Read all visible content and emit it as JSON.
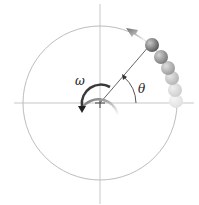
{
  "diagram": {
    "labels": {
      "omega": "ω",
      "theta": "θ"
    },
    "colors": {
      "axis": "#c8c8c8",
      "circle": "#bdbdbd",
      "radius": "#555555",
      "omega_arrow": "#333333",
      "velocity_arrow": "#7a7a7a",
      "ball": "#6e6e6e"
    }
  }
}
